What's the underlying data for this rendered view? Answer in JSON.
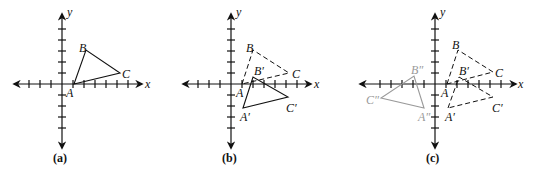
{
  "panels": [
    {
      "id": "a",
      "caption": "(a)",
      "origin": [
        62,
        84
      ],
      "axis_labels": {
        "x": "x",
        "y": "y"
      },
      "triangles": [
        {
          "name": "ABC",
          "style": "solid",
          "color": "#111111",
          "points": {
            "A": [
              74,
              84
            ],
            "B": [
              86,
              50
            ],
            "C": [
              120,
              73
            ]
          },
          "labels": {
            "A": "A",
            "B": "B",
            "C": "C"
          }
        }
      ]
    },
    {
      "id": "b",
      "caption": "(b)",
      "origin": [
        231,
        84
      ],
      "axis_labels": {
        "x": "x",
        "y": "y"
      },
      "triangles": [
        {
          "name": "ABC",
          "style": "dashed",
          "color": "#111111",
          "points": {
            "A": [
              242,
              84
            ],
            "B": [
              253,
              50
            ],
            "C": [
              289,
              73
            ]
          },
          "labels": {
            "A": "A",
            "B": "B",
            "C": "C"
          }
        },
        {
          "name": "A'B'C'",
          "style": "solid",
          "color": "#111111",
          "points": {
            "A": [
              243,
              108
            ],
            "B": [
              253,
              77
            ],
            "C": [
              288,
              97
            ]
          },
          "labels": {
            "A": "A′",
            "B": "B′",
            "C": "C′"
          }
        }
      ]
    },
    {
      "id": "c",
      "caption": "(c)",
      "origin": [
        435,
        84
      ],
      "axis_labels": {
        "x": "x",
        "y": "y"
      },
      "triangles": [
        {
          "name": "ABC",
          "style": "dashed",
          "color": "#111111",
          "points": {
            "A": [
              447,
              84
            ],
            "B": [
              458,
              50
            ],
            "C": [
              493,
              72
            ]
          },
          "labels": {
            "A": "A",
            "B": "B",
            "C": "C"
          }
        },
        {
          "name": "A'B'C'",
          "style": "dashed",
          "color": "#111111",
          "points": {
            "A": [
              448,
              108
            ],
            "B": [
              459,
              77
            ],
            "C": [
              493,
              97
            ]
          },
          "labels": {
            "A": "A′",
            "B": "B′",
            "C": "C′"
          }
        },
        {
          "name": "A''B''C''",
          "style": "solid",
          "color": "#9a9a9a",
          "points": {
            "A": [
              424,
              108
            ],
            "B": [
              414,
              76
            ],
            "C": [
              381,
              98
            ]
          },
          "labels": {
            "A": "A″",
            "B": "B″",
            "C": "C″"
          }
        }
      ]
    }
  ]
}
